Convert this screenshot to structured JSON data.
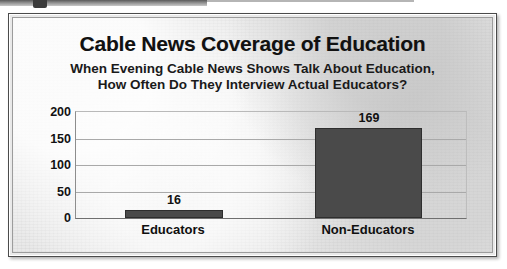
{
  "artifact": {
    "top_strip": "scan-edge-artifact"
  },
  "chart_data": {
    "type": "bar",
    "title": "Cable News Coverage of Education",
    "subtitle_line1": "When Evening Cable News Shows Talk About Education,",
    "subtitle_line2": "How Often Do They Interview Actual Educators?",
    "categories": [
      "Educators",
      "Non-Educators"
    ],
    "values": [
      16,
      169
    ],
    "value_labels": [
      "16",
      "169"
    ],
    "xlabel": "",
    "ylabel": "",
    "ylim": [
      0,
      200
    ],
    "yticks": [
      200,
      150,
      100,
      50,
      0
    ],
    "ytick_labels": [
      "200",
      "150",
      "100",
      "50",
      "0"
    ],
    "grid": true,
    "legend": false,
    "bar_color": "#4a4a4a",
    "background_color": "#e8e8e8",
    "text_color": "#111111"
  }
}
